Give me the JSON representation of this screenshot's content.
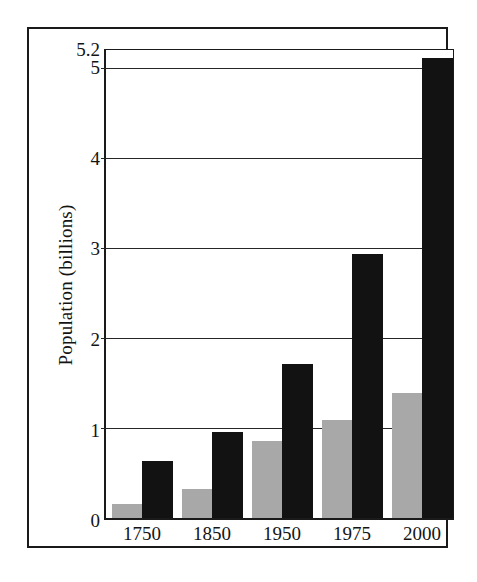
{
  "figure": {
    "background_color": "#ffffff",
    "frame_color": "#1a1a1a"
  },
  "chart_data": {
    "type": "bar",
    "title": "",
    "subtitle": "",
    "xlabel": "",
    "ylabel": "Population (billions)",
    "categories": [
      "1750",
      "1850",
      "1950",
      "1975",
      "2000"
    ],
    "series": [
      {
        "name": "series-1-gray",
        "color": "#a8a8a8",
        "values": [
          0.15,
          0.32,
          0.85,
          1.09,
          1.39
        ]
      },
      {
        "name": "series-2-black",
        "color": "#121212",
        "values": [
          0.63,
          0.96,
          1.71,
          2.93,
          5.11
        ]
      }
    ],
    "ylim": [
      0,
      5.2
    ],
    "yticks": [
      0,
      1,
      2,
      3,
      4,
      5,
      5.2
    ],
    "ytick_labels": [
      "0",
      "1",
      "2",
      "3",
      "4",
      "5",
      "5.2"
    ],
    "gridlines": [
      1,
      2,
      3,
      4,
      5
    ],
    "grid": true,
    "legend": null,
    "legend_position": "none",
    "annotations": []
  }
}
